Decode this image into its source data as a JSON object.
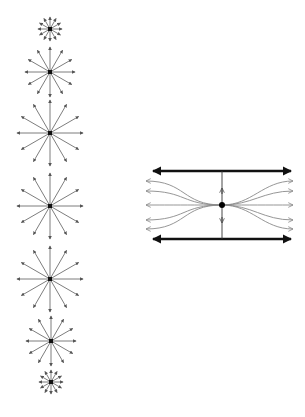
{
  "figure": {
    "colors": {
      "background": "#ffffff",
      "star_rays": "#6e6e6e",
      "plates": "#111111",
      "field_lines": "#8a8a8a",
      "charge": "#000000"
    }
  },
  "stars": {
    "rays_per_star": 12,
    "items": [
      {
        "cx": 50,
        "cy": 29,
        "r": 12
      },
      {
        "cx": 50,
        "cy": 72,
        "r": 25
      },
      {
        "cx": 50,
        "cy": 133,
        "r": 33
      },
      {
        "cx": 50,
        "cy": 206,
        "r": 33
      },
      {
        "cx": 50,
        "cy": 279,
        "r": 33
      },
      {
        "cx": 51,
        "cy": 341,
        "r": 25
      },
      {
        "cx": 51,
        "cy": 382,
        "r": 12
      }
    ]
  },
  "plates_diagram": {
    "center": {
      "x": 222,
      "y": 205
    },
    "top_plate": {
      "x1": 150,
      "x2": 294,
      "y": 171
    },
    "bottom_plate": {
      "x1": 150,
      "x2": 294,
      "y": 239
    },
    "field_line_ys": [
      181,
      191,
      205,
      220,
      229
    ],
    "field_left_x": 146,
    "field_right_x": 293,
    "vertical_arrows": {
      "up_y": 188,
      "down_y": 223
    }
  }
}
